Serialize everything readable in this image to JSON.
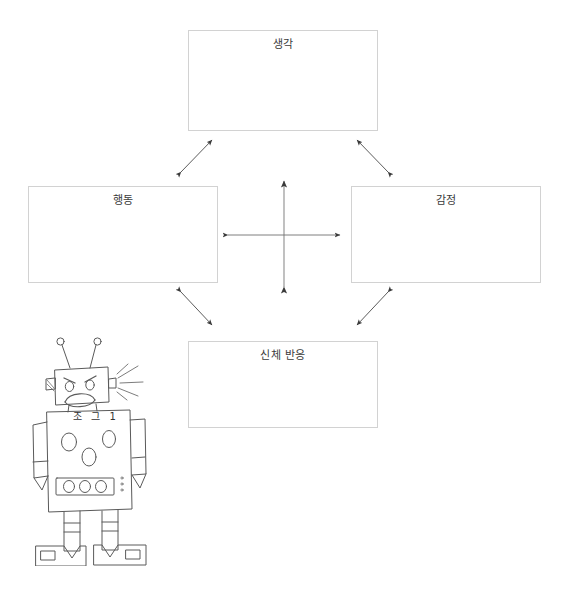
{
  "diagram": {
    "background_color": "#ffffff",
    "box_border_color": "#d2d2d2",
    "arrow_color": "#4a4a4a",
    "nodes": [
      {
        "id": "thought",
        "label": "생각",
        "position": "top"
      },
      {
        "id": "behavior",
        "label": "행동",
        "position": "left"
      },
      {
        "id": "emotion",
        "label": "감정",
        "position": "right"
      },
      {
        "id": "body",
        "label": "신체 반응",
        "position": "bottom"
      }
    ],
    "connectors": [
      {
        "id": "thought-behavior",
        "from": "thought",
        "to": "behavior",
        "style": "double-headed-diagonal"
      },
      {
        "id": "thought-emotion",
        "from": "thought",
        "to": "emotion",
        "style": "double-headed-diagonal"
      },
      {
        "id": "behavior-body",
        "from": "behavior",
        "to": "body",
        "style": "double-headed-diagonal"
      },
      {
        "id": "emotion-body",
        "from": "emotion",
        "to": "body",
        "style": "double-headed-diagonal"
      },
      {
        "id": "vertical-center",
        "from": "thought",
        "to": "body",
        "style": "double-headed-vertical"
      },
      {
        "id": "horizontal-center",
        "from": "behavior",
        "to": "emotion",
        "style": "double-headed-horizontal"
      }
    ]
  },
  "robot": {
    "name": "angry-robot-sketch",
    "chest_text": "조 그 1",
    "expression": "angry",
    "line_color": "#555555",
    "features": [
      "antenna-left",
      "antenna-right",
      "head",
      "angry-eyebrows",
      "eyes",
      "frown-mouth",
      "ear-left",
      "ear-right",
      "spark-lines",
      "torso",
      "chest-dials",
      "button-bar",
      "arm-left",
      "arm-right",
      "leg-left",
      "leg-right",
      "foot-left",
      "foot-right"
    ]
  }
}
